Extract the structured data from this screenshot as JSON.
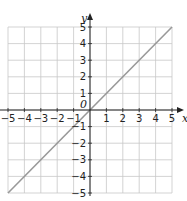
{
  "chart_data": {
    "type": "line",
    "title": "",
    "xlabel": "x",
    "ylabel": "y",
    "xlim": [
      -5,
      5
    ],
    "ylim": [
      -5,
      5
    ],
    "grid": true,
    "x_ticks": [
      "-5",
      "-4",
      "-3",
      "-2",
      "-1",
      "1",
      "2",
      "3",
      "4",
      "5"
    ],
    "y_ticks": [
      "5",
      "4",
      "3",
      "2",
      "1",
      "-1",
      "-2",
      "-3",
      "-4",
      "-5"
    ],
    "origin_label": "0",
    "series": [
      {
        "name": "y = x",
        "x": [
          -5,
          5
        ],
        "y": [
          -5,
          5
        ],
        "color": "#999999"
      }
    ]
  },
  "colors": {
    "grid": "#c8c8c8",
    "axis": "#222222",
    "line": "#9a9a9a"
  }
}
